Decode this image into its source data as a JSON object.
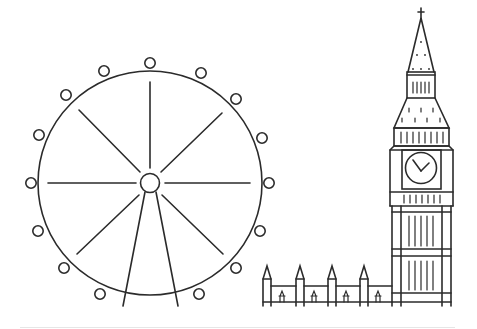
{
  "illustration": {
    "subject": "London skyline line art",
    "elements": [
      {
        "name": "London Eye",
        "type": "ferris-wheel",
        "spokes": 8,
        "capsules": 18
      },
      {
        "name": "Big Ben",
        "type": "clock-tower",
        "clock_hands": "approx 10:10"
      },
      {
        "name": "Houses of Parliament",
        "type": "building",
        "spires": 4
      }
    ],
    "colors": {
      "line": "#2b2b2b",
      "background": "#ffffff",
      "ground": "#e6e6e6"
    }
  }
}
